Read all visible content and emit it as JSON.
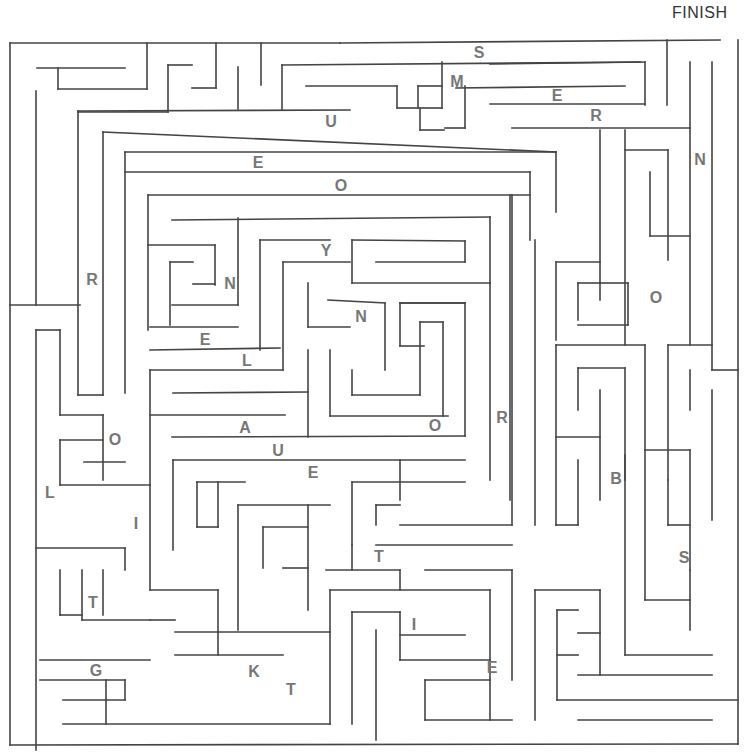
{
  "puzzle": {
    "finish_label": "FINISH",
    "wall_color": "#444444",
    "letter_color": "#777777",
    "letters": [
      {
        "ch": "S",
        "x": 479,
        "y": 53
      },
      {
        "ch": "M",
        "x": 457,
        "y": 82
      },
      {
        "ch": "E",
        "x": 557,
        "y": 96
      },
      {
        "ch": "U",
        "x": 331,
        "y": 122
      },
      {
        "ch": "R",
        "x": 596,
        "y": 116
      },
      {
        "ch": "N",
        "x": 700,
        "y": 160
      },
      {
        "ch": "E",
        "x": 258,
        "y": 163
      },
      {
        "ch": "O",
        "x": 341,
        "y": 186
      },
      {
        "ch": "Y",
        "x": 326,
        "y": 251
      },
      {
        "ch": "R",
        "x": 92,
        "y": 280
      },
      {
        "ch": "N",
        "x": 230,
        "y": 284
      },
      {
        "ch": "O",
        "x": 656,
        "y": 298
      },
      {
        "ch": "N",
        "x": 361,
        "y": 317
      },
      {
        "ch": "E",
        "x": 205,
        "y": 340
      },
      {
        "ch": "L",
        "x": 247,
        "y": 361
      },
      {
        "ch": "R",
        "x": 502,
        "y": 418
      },
      {
        "ch": "A",
        "x": 245,
        "y": 428
      },
      {
        "ch": "O",
        "x": 435,
        "y": 426
      },
      {
        "ch": "O",
        "x": 115,
        "y": 440
      },
      {
        "ch": "U",
        "x": 278,
        "y": 451
      },
      {
        "ch": "E",
        "x": 313,
        "y": 473
      },
      {
        "ch": "B",
        "x": 616,
        "y": 479
      },
      {
        "ch": "L",
        "x": 50,
        "y": 493
      },
      {
        "ch": "I",
        "x": 136,
        "y": 524
      },
      {
        "ch": "T",
        "x": 379,
        "y": 557
      },
      {
        "ch": "S",
        "x": 684,
        "y": 558
      },
      {
        "ch": "T",
        "x": 93,
        "y": 603
      },
      {
        "ch": "I",
        "x": 414,
        "y": 625
      },
      {
        "ch": "G",
        "x": 96,
        "y": 671
      },
      {
        "ch": "E",
        "x": 492,
        "y": 668
      },
      {
        "ch": "K",
        "x": 254,
        "y": 672
      },
      {
        "ch": "T",
        "x": 291,
        "y": 690
      }
    ],
    "walls": [
      [
        10,
        43,
        340,
        43
      ],
      [
        340,
        43,
        720,
        40
      ],
      [
        738,
        40,
        738,
        744
      ],
      [
        10,
        43,
        10,
        745
      ],
      [
        10,
        745,
        738,
        744
      ],
      [
        37,
        68,
        125,
        68
      ],
      [
        58,
        68,
        58,
        89
      ],
      [
        58,
        89,
        147,
        89
      ],
      [
        147,
        43,
        147,
        89
      ],
      [
        36,
        91,
        36,
        305
      ],
      [
        10,
        305,
        80,
        305
      ],
      [
        78,
        112,
        168,
        112
      ],
      [
        168,
        65,
        168,
        112
      ],
      [
        168,
        65,
        192,
        65
      ],
      [
        192,
        88,
        216,
        88
      ],
      [
        216,
        43,
        216,
        88
      ],
      [
        238,
        67,
        238,
        109
      ],
      [
        261,
        43,
        261,
        85
      ],
      [
        282,
        65,
        282,
        110
      ],
      [
        282,
        65,
        640,
        62
      ],
      [
        306,
        86,
        397,
        86
      ],
      [
        397,
        86,
        397,
        108
      ],
      [
        397,
        108,
        418,
        108
      ],
      [
        418,
        86,
        418,
        108
      ],
      [
        418,
        86,
        442,
        86
      ],
      [
        442,
        62,
        442,
        108
      ],
      [
        442,
        108,
        420,
        108
      ],
      [
        420,
        108,
        420,
        130
      ],
      [
        420,
        130,
        444,
        130
      ],
      [
        456,
        88,
        625,
        86
      ],
      [
        465,
        86,
        465,
        128
      ],
      [
        445,
        128,
        465,
        128
      ],
      [
        490,
        64,
        645,
        62
      ],
      [
        645,
        62,
        645,
        105
      ],
      [
        490,
        104,
        645,
        104
      ],
      [
        512,
        128,
        690,
        128
      ],
      [
        667,
        40,
        667,
        105
      ],
      [
        690,
        62,
        690,
        345
      ],
      [
        712,
        62,
        712,
        370
      ],
      [
        78,
        111,
        350,
        110
      ],
      [
        78,
        111,
        78,
        395
      ],
      [
        78,
        395,
        103,
        395
      ],
      [
        103,
        132,
        103,
        395
      ],
      [
        103,
        132,
        556,
        152
      ],
      [
        556,
        152,
        556,
        212
      ],
      [
        125,
        152,
        556,
        152
      ],
      [
        125,
        152,
        125,
        393
      ],
      [
        125,
        172,
        530,
        172
      ],
      [
        530,
        172,
        530,
        240
      ],
      [
        148,
        195,
        530,
        195
      ],
      [
        148,
        195,
        148,
        330
      ],
      [
        148,
        245,
        215,
        245
      ],
      [
        170,
        262,
        193,
        262
      ],
      [
        170,
        262,
        170,
        325
      ],
      [
        193,
        284,
        215,
        284
      ],
      [
        215,
        245,
        215,
        285
      ],
      [
        172,
        220,
        490,
        217
      ],
      [
        490,
        217,
        490,
        283
      ],
      [
        238,
        218,
        238,
        305
      ],
      [
        172,
        305,
        238,
        305
      ],
      [
        150,
        327,
        238,
        327
      ],
      [
        150,
        350,
        280,
        348
      ],
      [
        260,
        240,
        330,
        240
      ],
      [
        260,
        240,
        260,
        350
      ],
      [
        283,
        262,
        350,
        262
      ],
      [
        283,
        262,
        283,
        370
      ],
      [
        150,
        370,
        283,
        370
      ],
      [
        150,
        370,
        150,
        590
      ],
      [
        352,
        240,
        465,
        241
      ],
      [
        352,
        240,
        352,
        283
      ],
      [
        376,
        262,
        465,
        262
      ],
      [
        465,
        241,
        465,
        262
      ],
      [
        352,
        283,
        490,
        283
      ],
      [
        308,
        283,
        308,
        327
      ],
      [
        308,
        327,
        350,
        327
      ],
      [
        328,
        300,
        385,
        303
      ],
      [
        385,
        303,
        385,
        370
      ],
      [
        400,
        303,
        465,
        303
      ],
      [
        400,
        303,
        465,
        303
      ],
      [
        465,
        303,
        465,
        436
      ],
      [
        400,
        303,
        400,
        346
      ],
      [
        400,
        346,
        424,
        346
      ],
      [
        330,
        350,
        330,
        416
      ],
      [
        330,
        416,
        448,
        416
      ],
      [
        352,
        370,
        352,
        395
      ],
      [
        352,
        395,
        420,
        395
      ],
      [
        420,
        322,
        420,
        395
      ],
      [
        420,
        322,
        443,
        322
      ],
      [
        443,
        322,
        443,
        416
      ],
      [
        173,
        393,
        308,
        392
      ],
      [
        308,
        350,
        308,
        437
      ],
      [
        150,
        415,
        285,
        415
      ],
      [
        172,
        437,
        465,
        436
      ],
      [
        490,
        283,
        490,
        480
      ],
      [
        510,
        195,
        510,
        500
      ],
      [
        512,
        195,
        512,
        525
      ],
      [
        535,
        240,
        535,
        525
      ],
      [
        36,
        330,
        36,
        750
      ],
      [
        36,
        330,
        60,
        330
      ],
      [
        60,
        330,
        60,
        415
      ],
      [
        60,
        415,
        103,
        415
      ],
      [
        103,
        415,
        103,
        480
      ],
      [
        60,
        440,
        103,
        440
      ],
      [
        60,
        440,
        60,
        485
      ],
      [
        84,
        462,
        125,
        462
      ],
      [
        60,
        485,
        150,
        485
      ],
      [
        556,
        262,
        600,
        262
      ],
      [
        556,
        262,
        556,
        340
      ],
      [
        578,
        283,
        600,
        283
      ],
      [
        578,
        283,
        578,
        320
      ],
      [
        600,
        283,
        628,
        283
      ],
      [
        628,
        283,
        628,
        325
      ],
      [
        578,
        325,
        628,
        325
      ],
      [
        600,
        130,
        600,
        300
      ],
      [
        625,
        130,
        625,
        345
      ],
      [
        625,
        150,
        668,
        150
      ],
      [
        668,
        150,
        668,
        260
      ],
      [
        650,
        172,
        650,
        236
      ],
      [
        650,
        236,
        690,
        236
      ],
      [
        556,
        345,
        645,
        345
      ],
      [
        556,
        345,
        556,
        525
      ],
      [
        578,
        368,
        625,
        368
      ],
      [
        578,
        368,
        578,
        410
      ],
      [
        600,
        390,
        600,
        500
      ],
      [
        556,
        437,
        600,
        437
      ],
      [
        578,
        460,
        578,
        525
      ],
      [
        556,
        525,
        578,
        525
      ],
      [
        625,
        368,
        625,
        480
      ],
      [
        645,
        345,
        645,
        600
      ],
      [
        645,
        450,
        690,
        450
      ],
      [
        690,
        450,
        690,
        570
      ],
      [
        668,
        345,
        668,
        480
      ],
      [
        668,
        345,
        712,
        345
      ],
      [
        712,
        370,
        738,
        370
      ],
      [
        690,
        370,
        690,
        410
      ],
      [
        712,
        390,
        712,
        520
      ],
      [
        668,
        480,
        668,
        525
      ],
      [
        668,
        525,
        690,
        525
      ],
      [
        173,
        460,
        465,
        460
      ],
      [
        173,
        460,
        173,
        550
      ],
      [
        197,
        482,
        245,
        482
      ],
      [
        197,
        482,
        197,
        527
      ],
      [
        197,
        527,
        218,
        527
      ],
      [
        218,
        482,
        218,
        527
      ],
      [
        238,
        505,
        330,
        505
      ],
      [
        238,
        505,
        238,
        630
      ],
      [
        263,
        527,
        308,
        527
      ],
      [
        263,
        527,
        263,
        568
      ],
      [
        308,
        505,
        308,
        610
      ],
      [
        283,
        568,
        308,
        568
      ],
      [
        352,
        482,
        465,
        482
      ],
      [
        352,
        482,
        352,
        545
      ],
      [
        376,
        505,
        400,
        505
      ],
      [
        400,
        460,
        400,
        500
      ],
      [
        376,
        505,
        376,
        525
      ],
      [
        400,
        525,
        512,
        525
      ],
      [
        376,
        545,
        512,
        545
      ],
      [
        352,
        545,
        352,
        570
      ],
      [
        326,
        570,
        400,
        570
      ],
      [
        400,
        570,
        400,
        590
      ],
      [
        425,
        570,
        512,
        570
      ],
      [
        150,
        590,
        218,
        590
      ],
      [
        218,
        590,
        218,
        632
      ],
      [
        150,
        620,
        175,
        620
      ],
      [
        175,
        632,
        330,
        632
      ],
      [
        218,
        632,
        218,
        655
      ],
      [
        175,
        655,
        283,
        655
      ],
      [
        36,
        548,
        125,
        548
      ],
      [
        60,
        570,
        60,
        615
      ],
      [
        125,
        548,
        125,
        570
      ],
      [
        82,
        570,
        82,
        620
      ],
      [
        103,
        570,
        103,
        615
      ],
      [
        82,
        620,
        150,
        620
      ],
      [
        60,
        615,
        82,
        615
      ],
      [
        40,
        660,
        150,
        660
      ],
      [
        40,
        680,
        125,
        680
      ],
      [
        125,
        680,
        125,
        700
      ],
      [
        63,
        700,
        125,
        700
      ],
      [
        106,
        680,
        106,
        724
      ],
      [
        63,
        724,
        330,
        724
      ],
      [
        330,
        590,
        490,
        590
      ],
      [
        330,
        590,
        330,
        724
      ],
      [
        352,
        612,
        400,
        612
      ],
      [
        352,
        612,
        352,
        724
      ],
      [
        400,
        612,
        400,
        660
      ],
      [
        400,
        635,
        465,
        635
      ],
      [
        400,
        660,
        490,
        660
      ],
      [
        376,
        630,
        376,
        740
      ],
      [
        425,
        680,
        490,
        680
      ],
      [
        425,
        680,
        425,
        720
      ],
      [
        425,
        720,
        512,
        720
      ],
      [
        490,
        590,
        490,
        720
      ],
      [
        512,
        570,
        512,
        680
      ],
      [
        535,
        590,
        535,
        720
      ],
      [
        535,
        590,
        600,
        590
      ],
      [
        557,
        610,
        578,
        610
      ],
      [
        557,
        610,
        557,
        700
      ],
      [
        557,
        655,
        578,
        655
      ],
      [
        578,
        633,
        600,
        633
      ],
      [
        600,
        590,
        600,
        675
      ],
      [
        578,
        675,
        712,
        675
      ],
      [
        557,
        700,
        738,
        700
      ],
      [
        578,
        720,
        712,
        720
      ],
      [
        625,
        455,
        625,
        655
      ],
      [
        625,
        655,
        712,
        655
      ],
      [
        645,
        600,
        690,
        600
      ],
      [
        690,
        570,
        690,
        630
      ]
    ]
  }
}
